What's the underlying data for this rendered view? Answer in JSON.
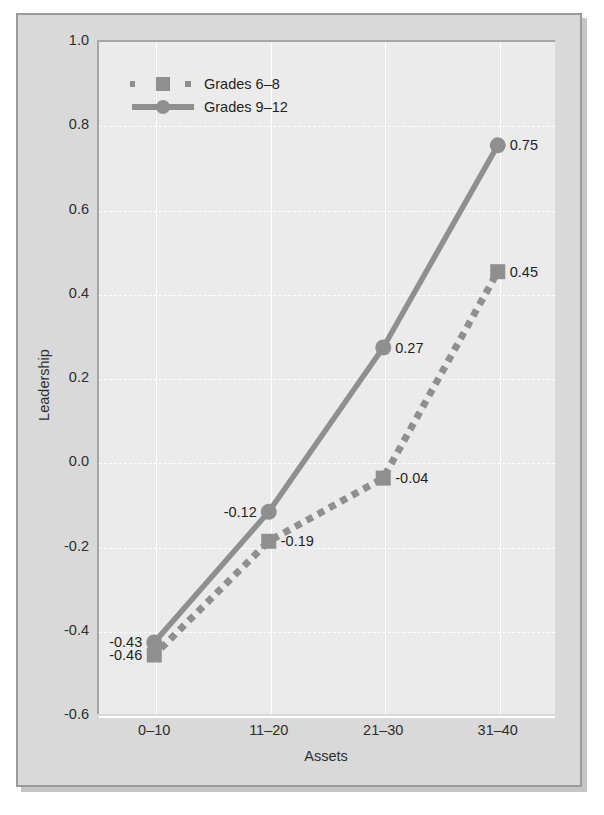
{
  "chart_data": {
    "type": "line",
    "title": "",
    "xlabel": "Assets",
    "ylabel": "Leadership",
    "categories": [
      "0–10",
      "11–20",
      "21–30",
      "31–40"
    ],
    "ylim": [
      -0.6,
      1.0
    ],
    "yticks": [
      "1.0",
      "0.8",
      "0.6",
      "0.4",
      "0.2",
      "0.0",
      "-0.2",
      "-0.4",
      "-0.6"
    ],
    "ytick_values": [
      1.0,
      0.8,
      0.6,
      0.4,
      0.2,
      0.0,
      -0.2,
      -0.4,
      -0.6
    ],
    "grid": "horizontal-dashed-and-vertical-solid",
    "legend_position": "upper-left-inside",
    "series": [
      {
        "name": "Grades 6–8",
        "values": [
          -0.46,
          -0.19,
          -0.04,
          0.45
        ],
        "labels": [
          "-0.46",
          "-0.19",
          "-0.04",
          "0.45"
        ],
        "label_side": [
          "left",
          "right",
          "right",
          "right"
        ],
        "line_style": "dotted",
        "marker": "square",
        "color": "#8f8f8f"
      },
      {
        "name": "Grades 9–12",
        "values": [
          -0.43,
          -0.12,
          0.27,
          0.75
        ],
        "labels": [
          "-0.43",
          "-0.12",
          "0.27",
          "0.75"
        ],
        "label_side": [
          "left",
          "left",
          "right",
          "right"
        ],
        "line_style": "solid",
        "marker": "circle",
        "color": "#8f8f8f"
      }
    ]
  },
  "colors": {
    "page_background": "#ffffff",
    "figure_background": "#d9d9d9",
    "plot_background": "#ebebeb",
    "gridline": "#ffffff",
    "series_gray": "#8f8f8f",
    "text": "#2e2e2e",
    "frame_border": "#9a9a9a"
  }
}
